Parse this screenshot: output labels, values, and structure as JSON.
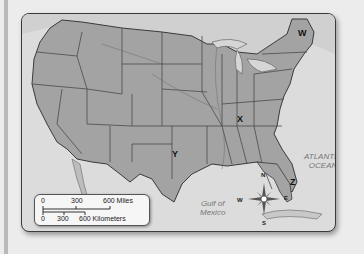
{
  "map": {
    "title": "United States map",
    "labels": {
      "W": "W",
      "X": "X",
      "Y": "Y",
      "Z": "Z"
    },
    "water_bodies": {
      "atlantic_line1": "ATLANTIC",
      "atlantic_line2": "OCEAN",
      "gulf_line1": "Gulf of",
      "gulf_line2": "Mexico"
    },
    "compass": {
      "north": "N",
      "south": "S",
      "east": "E",
      "west": "W"
    },
    "scale": {
      "miles": {
        "ticks": [
          "0",
          "300",
          "600 Miles"
        ]
      },
      "kilometers": {
        "ticks": [
          "0",
          "300",
          "600 Kilometers"
        ]
      }
    },
    "colors": {
      "land": "#a3a3a3",
      "water": "#dcdcdc",
      "border": "#3a3a3a",
      "background": "#ececec"
    }
  }
}
